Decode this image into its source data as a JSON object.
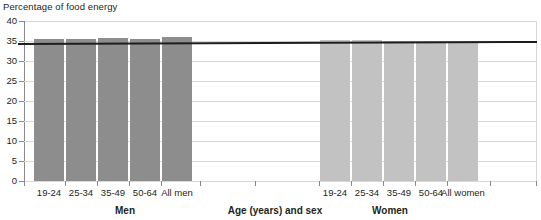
{
  "chart_data": {
    "type": "bar",
    "title": "Percentage of food energy",
    "xlabel": "Age (years) and sex",
    "ylabel": "",
    "ylim": [
      0,
      40
    ],
    "ytick_step": 5,
    "yticks": [
      "0",
      "5",
      "10",
      "15",
      "20",
      "25",
      "30",
      "35",
      "40"
    ],
    "grid": true,
    "legend": "none",
    "categories": [
      "19-24",
      "25-34",
      "35-49",
      "50-64",
      "All men",
      "19-24",
      "25-34",
      "35-49",
      "50-64",
      "All women"
    ],
    "values": [
      35.6,
      35.5,
      35.7,
      35.4,
      36.0,
      35.2,
      35.2,
      34.9,
      34.9,
      34.9
    ],
    "groups": [
      {
        "name": "Men",
        "color": "#8d8d8d",
        "categories": [
          "19-24",
          "25-34",
          "35-49",
          "50-64",
          "All men"
        ],
        "values": [
          35.6,
          35.5,
          35.7,
          35.4,
          36.0
        ]
      },
      {
        "name": "Women",
        "color": "#c2c2c2",
        "categories": [
          "19-24",
          "25-34",
          "35-49",
          "50-64",
          "All women"
        ],
        "values": [
          35.2,
          35.2,
          34.9,
          34.9,
          34.9
        ]
      }
    ],
    "reference_line": {
      "label": "35",
      "value": 35,
      "color": "#1d1d1d"
    },
    "annotations": []
  },
  "axis": {
    "y_title": "Percentage of food energy",
    "x_title": "Age (years) and sex"
  },
  "colors": {
    "men_bar": "#8d8d8d",
    "women_bar": "#c2c2c2",
    "gridline": "#d8d8d8",
    "axis": "#8a8a8a",
    "reference": "#1d1d1d",
    "text": "#231f20"
  },
  "group_labels": {
    "men": "Men",
    "axis_center": "Age (years) and sex",
    "women": "Women"
  }
}
